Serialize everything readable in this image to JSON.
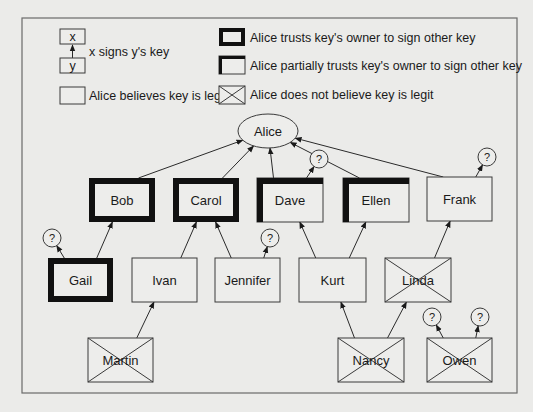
{
  "diagram": {
    "colors": {
      "background": "#ebebe9",
      "stroke": "#2a2a2a",
      "thick_border": "#111111",
      "frame": "#6a6a6a"
    },
    "legend": {
      "signs": {
        "x_label": "x",
        "y_label": "y",
        "text": "x signs y's key"
      },
      "believes": {
        "text": "Alice believes key is legit"
      },
      "trusts": {
        "text": "Alice trusts key's owner to sign other key"
      },
      "partial": {
        "text": "Alice partially trusts key's owner to sign other key"
      },
      "not_believe": {
        "text": "Alice does not believe key is legit"
      }
    },
    "root": {
      "id": "alice",
      "label": "Alice",
      "shape": "ellipse",
      "cx": 268,
      "cy": 131,
      "rx": 30,
      "ry": 17
    },
    "nodes": [
      {
        "id": "bob",
        "label": "Bob",
        "x": 89,
        "y": 178,
        "w": 66,
        "h": 44,
        "trust": "full",
        "legit": true
      },
      {
        "id": "carol",
        "label": "Carol",
        "x": 173,
        "y": 178,
        "w": 66,
        "h": 44,
        "trust": "full",
        "legit": true
      },
      {
        "id": "dave",
        "label": "Dave",
        "x": 257,
        "y": 178,
        "w": 66,
        "h": 44,
        "trust": "partial",
        "legit": true
      },
      {
        "id": "ellen",
        "label": "Ellen",
        "x": 343,
        "y": 178,
        "w": 66,
        "h": 44,
        "trust": "partial",
        "legit": true
      },
      {
        "id": "frank",
        "label": "Frank",
        "x": 427,
        "y": 177,
        "w": 65,
        "h": 44,
        "trust": "none",
        "legit": true
      },
      {
        "id": "gail",
        "label": "Gail",
        "x": 48,
        "y": 258,
        "w": 65,
        "h": 44,
        "trust": "full",
        "legit": true
      },
      {
        "id": "ivan",
        "label": "Ivan",
        "x": 132,
        "y": 258,
        "w": 65,
        "h": 44,
        "trust": "none",
        "legit": true
      },
      {
        "id": "jennifer",
        "label": "Jennifer",
        "x": 215,
        "y": 258,
        "w": 65,
        "h": 44,
        "trust": "none",
        "legit": true
      },
      {
        "id": "kurt",
        "label": "Kurt",
        "x": 299,
        "y": 258,
        "w": 67,
        "h": 44,
        "trust": "none",
        "legit": true
      },
      {
        "id": "linda",
        "label": "Linda",
        "x": 385,
        "y": 258,
        "w": 66,
        "h": 44,
        "trust": "none",
        "legit": false
      },
      {
        "id": "martin",
        "label": "Martin",
        "x": 88,
        "y": 338,
        "w": 65,
        "h": 44,
        "trust": "none",
        "legit": false
      },
      {
        "id": "nancy",
        "label": "Nancy",
        "x": 338,
        "y": 338,
        "w": 66,
        "h": 44,
        "trust": "none",
        "legit": false
      },
      {
        "id": "owen",
        "label": "Owen",
        "x": 427,
        "y": 338,
        "w": 65,
        "h": 44,
        "trust": "none",
        "legit": false
      }
    ],
    "unknowns": [
      {
        "id": "q_dave",
        "label": "?",
        "cx": 319,
        "cy": 159,
        "r": 9
      },
      {
        "id": "q_frank",
        "label": "?",
        "cx": 487,
        "cy": 157,
        "r": 9
      },
      {
        "id": "q_gail",
        "label": "?",
        "cx": 52,
        "cy": 238,
        "r": 9
      },
      {
        "id": "q_jennifer",
        "label": "?",
        "cx": 270,
        "cy": 238,
        "r": 9
      },
      {
        "id": "q_owen_left",
        "label": "?",
        "cx": 432,
        "cy": 317,
        "r": 9
      },
      {
        "id": "q_owen_right",
        "label": "?",
        "cx": 480,
        "cy": 317,
        "r": 9
      }
    ],
    "signatures": [
      {
        "from": "bob",
        "to": "alice"
      },
      {
        "from": "carol",
        "to": "alice"
      },
      {
        "from": "dave",
        "to": "alice"
      },
      {
        "from": "ellen",
        "to": "alice"
      },
      {
        "from": "frank",
        "to": "alice"
      },
      {
        "from": "dave",
        "to": "q_dave"
      },
      {
        "from": "frank",
        "to": "q_frank"
      },
      {
        "from": "gail",
        "to": "bob"
      },
      {
        "from": "gail",
        "to": "q_gail"
      },
      {
        "from": "ivan",
        "to": "carol"
      },
      {
        "from": "jennifer",
        "to": "carol"
      },
      {
        "from": "jennifer",
        "to": "q_jennifer"
      },
      {
        "from": "kurt",
        "to": "dave"
      },
      {
        "from": "kurt",
        "to": "ellen"
      },
      {
        "from": "linda",
        "to": "frank"
      },
      {
        "from": "martin",
        "to": "ivan"
      },
      {
        "from": "nancy",
        "to": "kurt"
      },
      {
        "from": "nancy",
        "to": "linda"
      },
      {
        "from": "owen",
        "to": "q_owen_left"
      },
      {
        "from": "owen",
        "to": "q_owen_right"
      }
    ]
  }
}
